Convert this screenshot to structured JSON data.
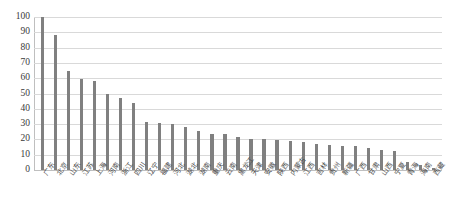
{
  "chart_data": {
    "type": "bar",
    "title": "",
    "xlabel": "",
    "ylabel": "",
    "ylim": [
      0,
      100
    ],
    "yticks": [
      0,
      10,
      20,
      30,
      40,
      50,
      60,
      70,
      80,
      90,
      100
    ],
    "grid": true,
    "legend": "none",
    "bar_color": "#808080",
    "gridline_color": "#d9d9d9",
    "categories": [
      "广东",
      "北京",
      "山东",
      "江苏",
      "上海",
      "河南",
      "浙江",
      "四川",
      "辽宁",
      "福建",
      "河北",
      "湖北",
      "湖南",
      "重庆",
      "云南",
      "黑龙江",
      "天津",
      "安徽",
      "陕西",
      "内蒙古",
      "江西",
      "吉林",
      "贵州",
      "新疆",
      "广西",
      "甘肃",
      "山西",
      "宁夏",
      "青海",
      "海南",
      "西藏"
    ],
    "values": [
      100,
      88,
      65,
      59.5,
      58,
      49.5,
      47,
      44,
      31.5,
      31,
      30,
      28,
      25.5,
      23.5,
      23.5,
      21.5,
      20.5,
      20,
      19.5,
      19,
      18,
      17,
      16.5,
      16,
      15.5,
      14.5,
      13,
      12.5,
      5.5,
      3,
      1.5
    ]
  }
}
